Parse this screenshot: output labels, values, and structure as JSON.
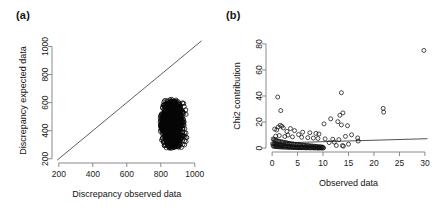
{
  "figure": {
    "background": "#ffffff",
    "point_color": "#111111",
    "line_color": "#4d4d4d"
  },
  "panels": [
    {
      "id": "a",
      "label": "(a)",
      "chart_data": {
        "type": "scatter",
        "title": "",
        "xlabel": "Discrepancy observed data",
        "ylabel": "Discrepancy expected data",
        "xlim": [
          160,
          1060
        ],
        "ylim": [
          170,
          1060
        ],
        "xticks": [
          200,
          400,
          600,
          800,
          1000
        ],
        "yticks": [
          200,
          400,
          600,
          800,
          1000
        ],
        "grid": false,
        "legend": "none",
        "annotations": [
          "1:1 identity reference line drawn across full plot"
        ],
        "reference_line": {
          "type": "identity",
          "slope": 1,
          "intercept": 0,
          "from": [
            190,
            190
          ],
          "to": [
            1040,
            1040
          ]
        },
        "point_marker": "open-circle",
        "cluster_description": "Dense teardrop-shaped cloud of ~1000 overlapping open circles below the identity line",
        "cluster_bounds": {
          "x_min": 795,
          "x_max": 955,
          "y_min": 275,
          "y_max": 625,
          "x_center": 865,
          "y_center": 455
        },
        "points": [
          [
            862,
            612
          ],
          [
            855,
            601
          ],
          [
            871,
            596
          ],
          [
            848,
            588
          ],
          [
            878,
            583
          ],
          [
            840,
            575
          ],
          [
            866,
            570
          ],
          [
            884,
            566
          ],
          [
            833,
            560
          ],
          [
            858,
            554
          ],
          [
            875,
            549
          ],
          [
            891,
            545
          ],
          [
            827,
            540
          ],
          [
            851,
            535
          ],
          [
            868,
            530
          ],
          [
            886,
            526
          ],
          [
            903,
            522
          ],
          [
            822,
            517
          ],
          [
            845,
            512
          ],
          [
            862,
            508
          ],
          [
            880,
            504
          ],
          [
            897,
            500
          ],
          [
            913,
            496
          ],
          [
            818,
            492
          ],
          [
            840,
            488
          ],
          [
            857,
            484
          ],
          [
            874,
            481
          ],
          [
            891,
            477
          ],
          [
            908,
            473
          ],
          [
            924,
            470
          ],
          [
            814,
            466
          ],
          [
            836,
            462
          ],
          [
            853,
            459
          ],
          [
            870,
            455
          ],
          [
            887,
            452
          ],
          [
            904,
            448
          ],
          [
            920,
            445
          ],
          [
            933,
            442
          ],
          [
            811,
            438
          ],
          [
            832,
            435
          ],
          [
            849,
            432
          ],
          [
            866,
            428
          ],
          [
            883,
            425
          ],
          [
            900,
            422
          ],
          [
            916,
            419
          ],
          [
            930,
            416
          ],
          [
            941,
            413
          ],
          [
            809,
            410
          ],
          [
            829,
            407
          ],
          [
            846,
            404
          ],
          [
            863,
            401
          ],
          [
            880,
            398
          ],
          [
            897,
            395
          ],
          [
            913,
            392
          ],
          [
            928,
            389
          ],
          [
            940,
            386
          ],
          [
            948,
            383
          ],
          [
            808,
            380
          ],
          [
            827,
            377
          ],
          [
            844,
            374
          ],
          [
            861,
            371
          ],
          [
            878,
            369
          ],
          [
            895,
            366
          ],
          [
            911,
            363
          ],
          [
            926,
            360
          ],
          [
            939,
            357
          ],
          [
            949,
            354
          ],
          [
            953,
            351
          ],
          [
            810,
            348
          ],
          [
            828,
            345
          ],
          [
            845,
            342
          ],
          [
            862,
            340
          ],
          [
            879,
            337
          ],
          [
            896,
            334
          ],
          [
            912,
            331
          ],
          [
            927,
            329
          ],
          [
            939,
            326
          ],
          [
            948,
            323
          ],
          [
            815,
            320
          ],
          [
            833,
            317
          ],
          [
            850,
            315
          ],
          [
            867,
            312
          ],
          [
            884,
            309
          ],
          [
            900,
            307
          ],
          [
            915,
            304
          ],
          [
            929,
            301
          ],
          [
            940,
            299
          ],
          [
            822,
            296
          ],
          [
            840,
            293
          ],
          [
            857,
            291
          ],
          [
            874,
            288
          ],
          [
            891,
            286
          ],
          [
            907,
            283
          ],
          [
            921,
            281
          ],
          [
            833,
            278
          ],
          [
            851,
            276
          ],
          [
            868,
            286
          ],
          [
            885,
            292
          ],
          [
            900,
            297
          ],
          [
            847,
            283
          ]
        ]
      }
    },
    {
      "id": "b",
      "label": "(b)",
      "chart_data": {
        "type": "scatter",
        "title": "",
        "xlabel": "Observed data",
        "ylabel": "Chi2 contribution",
        "xlim": [
          -1.2,
          31
        ],
        "ylim": [
          -3,
          83
        ],
        "xticks": [
          0,
          5,
          10,
          15,
          20,
          25,
          30
        ],
        "yticks": [
          0,
          20,
          40,
          60,
          80
        ],
        "grid": false,
        "legend": "none",
        "annotations": [
          "Nearly flat fitted regression line with slight positive slope"
        ],
        "fit_line": {
          "type": "linear",
          "from": [
            0,
            3.8
          ],
          "to": [
            30.5,
            7.2
          ]
        },
        "point_marker": "open-circle",
        "cluster_description": "Dense band of open circles between x=0 and x=10 at low Chi2 values, with scattered high outliers",
        "points": [
          [
            29.8,
            75.0
          ],
          [
            13.6,
            42.5
          ],
          [
            1.1,
            39.2
          ],
          [
            1.7,
            28.8
          ],
          [
            21.8,
            30.5
          ],
          [
            21.9,
            27.6
          ],
          [
            13.9,
            27.0
          ],
          [
            13.3,
            25.2
          ],
          [
            11.5,
            22.5
          ],
          [
            12.9,
            20.3
          ],
          [
            10.2,
            18.6
          ],
          [
            13.6,
            17.8
          ],
          [
            14.8,
            17.2
          ],
          [
            1.6,
            17.5
          ],
          [
            1.9,
            16.8
          ],
          [
            1.2,
            16.2
          ],
          [
            2.2,
            15.5
          ],
          [
            3.6,
            15.0
          ],
          [
            0.5,
            14.6
          ],
          [
            0.9,
            13.9
          ],
          [
            4.4,
            13.4
          ],
          [
            2.9,
            12.8
          ],
          [
            6.0,
            12.2
          ],
          [
            7.4,
            11.8
          ],
          [
            8.6,
            11.3
          ],
          [
            9.2,
            10.8
          ],
          [
            5.2,
            10.4
          ],
          [
            3.1,
            10.0
          ],
          [
            1.4,
            9.6
          ],
          [
            0.7,
            9.2
          ],
          [
            2.5,
            8.9
          ],
          [
            4.0,
            8.6
          ],
          [
            5.8,
            8.3
          ],
          [
            7.0,
            8.0
          ],
          [
            8.1,
            7.7
          ],
          [
            9.0,
            7.4
          ],
          [
            10.4,
            7.1
          ],
          [
            11.9,
            6.8
          ],
          [
            13.1,
            6.5
          ],
          [
            14.4,
            9.0
          ],
          [
            15.6,
            10.2
          ],
          [
            16.8,
            7.8
          ],
          [
            16.9,
            5.4
          ],
          [
            0.2,
            7.0
          ],
          [
            0.4,
            6.6
          ],
          [
            0.6,
            6.2
          ],
          [
            0.8,
            5.9
          ],
          [
            1.0,
            5.6
          ],
          [
            1.3,
            5.3
          ],
          [
            1.5,
            5.0
          ],
          [
            1.8,
            4.8
          ],
          [
            2.0,
            4.6
          ],
          [
            2.3,
            4.4
          ],
          [
            2.6,
            4.2
          ],
          [
            2.8,
            4.0
          ],
          [
            3.0,
            3.8
          ],
          [
            3.3,
            3.6
          ],
          [
            3.5,
            3.5
          ],
          [
            3.8,
            3.3
          ],
          [
            4.1,
            3.2
          ],
          [
            4.3,
            3.0
          ],
          [
            4.6,
            2.9
          ],
          [
            4.9,
            2.8
          ],
          [
            5.1,
            2.6
          ],
          [
            5.4,
            2.5
          ],
          [
            5.6,
            2.4
          ],
          [
            5.9,
            2.3
          ],
          [
            6.2,
            2.2
          ],
          [
            6.4,
            2.1
          ],
          [
            6.7,
            2.0
          ],
          [
            7.0,
            1.9
          ],
          [
            7.2,
            1.8
          ],
          [
            7.5,
            1.7
          ],
          [
            7.8,
            1.6
          ],
          [
            8.0,
            1.5
          ],
          [
            8.3,
            1.4
          ],
          [
            8.6,
            1.3
          ],
          [
            8.8,
            1.2
          ],
          [
            9.1,
            1.1
          ],
          [
            9.4,
            1.0
          ],
          [
            9.6,
            0.9
          ],
          [
            9.9,
            0.8
          ],
          [
            0.1,
            3.4
          ],
          [
            0.3,
            3.1
          ],
          [
            0.5,
            2.9
          ],
          [
            0.7,
            2.7
          ],
          [
            0.9,
            2.5
          ],
          [
            1.1,
            2.3
          ],
          [
            1.4,
            2.1
          ],
          [
            1.6,
            2.0
          ],
          [
            1.9,
            1.8
          ],
          [
            2.1,
            1.7
          ],
          [
            2.4,
            1.6
          ],
          [
            2.7,
            1.5
          ],
          [
            2.9,
            1.4
          ],
          [
            3.2,
            1.3
          ],
          [
            3.4,
            1.2
          ],
          [
            3.7,
            1.1
          ],
          [
            4.0,
            1.0
          ],
          [
            4.2,
            0.9
          ],
          [
            4.5,
            0.8
          ],
          [
            4.8,
            0.8
          ],
          [
            5.0,
            0.7
          ],
          [
            5.3,
            0.7
          ],
          [
            5.5,
            0.6
          ],
          [
            5.8,
            0.6
          ],
          [
            6.0,
            0.5
          ],
          [
            6.3,
            0.5
          ],
          [
            6.6,
            0.5
          ],
          [
            6.9,
            0.4
          ],
          [
            7.1,
            0.4
          ],
          [
            7.4,
            0.4
          ],
          [
            7.7,
            0.3
          ],
          [
            8.0,
            0.3
          ],
          [
            8.2,
            0.3
          ],
          [
            8.5,
            0.3
          ],
          [
            8.8,
            0.2
          ],
          [
            9.0,
            0.2
          ],
          [
            9.3,
            0.2
          ],
          [
            9.5,
            0.2
          ],
          [
            9.8,
            0.2
          ],
          [
            10.1,
            0.2
          ],
          [
            0.2,
            1.6
          ],
          [
            0.4,
            1.4
          ],
          [
            0.6,
            1.3
          ],
          [
            0.8,
            1.2
          ],
          [
            1.0,
            1.1
          ],
          [
            1.2,
            1.0
          ],
          [
            1.5,
            0.9
          ],
          [
            1.7,
            0.9
          ],
          [
            2.0,
            0.8
          ],
          [
            2.2,
            0.8
          ],
          [
            2.5,
            0.7
          ],
          [
            2.8,
            0.7
          ],
          [
            3.1,
            0.6
          ],
          [
            3.3,
            0.6
          ],
          [
            3.6,
            0.5
          ],
          [
            3.9,
            0.5
          ],
          [
            4.1,
            0.5
          ],
          [
            4.4,
            0.4
          ],
          [
            4.7,
            0.4
          ],
          [
            5.0,
            0.4
          ],
          [
            5.2,
            0.3
          ],
          [
            5.5,
            0.3
          ],
          [
            5.7,
            0.3
          ],
          [
            6.1,
            0.3
          ],
          [
            6.5,
            0.2
          ],
          [
            6.8,
            0.2
          ],
          [
            7.3,
            0.2
          ],
          [
            7.6,
            0.2
          ],
          [
            8.1,
            0.2
          ],
          [
            8.4,
            0.1
          ],
          [
            8.9,
            0.1
          ],
          [
            9.2,
            0.1
          ],
          [
            9.7,
            0.1
          ],
          [
            10.0,
            0.1
          ],
          [
            13.8,
            1.9
          ],
          [
            14.0,
            1.5
          ],
          [
            12.6,
            2.0
          ],
          [
            11.2,
            4.2
          ],
          [
            12.2,
            4.6
          ],
          [
            15.0,
            3.0
          ]
        ]
      }
    }
  ]
}
